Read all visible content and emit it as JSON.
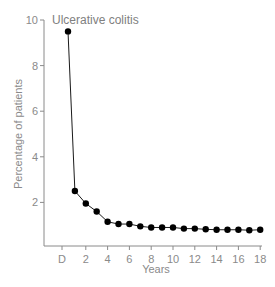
{
  "chart_data": {
    "type": "line",
    "title": "Ulcerative colitis",
    "xlabel": "Years",
    "ylabel": "Percentage of patients",
    "x_tick_labels": [
      "D",
      "2",
      "4",
      "6",
      "8",
      "10",
      "12",
      "14",
      "16",
      "18"
    ],
    "y_tick_labels": [
      "2",
      "4",
      "6",
      "8",
      "10"
    ],
    "ylim": [
      0,
      10
    ],
    "xlim": [
      -1,
      18.5
    ],
    "grid": false,
    "legend": null,
    "x": [
      0,
      1,
      2,
      3,
      4,
      5,
      6,
      7,
      8,
      9,
      10,
      11,
      12,
      13,
      14,
      15,
      16,
      17,
      18
    ],
    "series": [
      {
        "name": "Ulcerative colitis",
        "values": [
          9.5,
          2.5,
          1.95,
          1.6,
          1.15,
          1.05,
          1.05,
          0.95,
          0.9,
          0.9,
          0.9,
          0.85,
          0.85,
          0.82,
          0.8,
          0.8,
          0.8,
          0.78,
          0.8
        ]
      }
    ],
    "colors": {
      "line": "#1a1a1a",
      "marker": "#000000",
      "axis": "#8a8a8a",
      "text": "#8a8a8a"
    }
  }
}
